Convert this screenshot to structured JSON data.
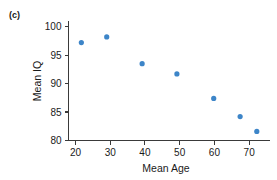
{
  "panel": {
    "label": "(c)"
  },
  "chart_data": {
    "type": "scatter",
    "title": "",
    "xlabel": "Mean Age",
    "ylabel": "Mean IQ",
    "xlim": [
      18,
      76
    ],
    "ylim": [
      80,
      101
    ],
    "xticks": [
      20,
      30,
      40,
      50,
      60,
      70
    ],
    "yticks": [
      80,
      85,
      90,
      95,
      100
    ],
    "xticklabels": [
      "20",
      "30",
      "40",
      "50",
      "60",
      "70"
    ],
    "yticklabels": [
      "80",
      "85",
      "90",
      "95",
      "100"
    ],
    "grid": false,
    "legend": false,
    "marker_color": "#3d85c8",
    "marker_size": 4,
    "series": [
      {
        "name": "Mean IQ by Mean Age",
        "x": [
          21.7,
          29.0,
          39.2,
          49.2,
          59.8,
          67.4,
          72.2
        ],
        "y": [
          97.2,
          98.2,
          93.5,
          91.7,
          87.4,
          84.2,
          81.6
        ]
      }
    ],
    "points": [
      {
        "x": 21.7,
        "y": 97.2
      },
      {
        "x": 29.0,
        "y": 98.2
      },
      {
        "x": 39.2,
        "y": 93.5
      },
      {
        "x": 49.2,
        "y": 91.7
      },
      {
        "x": 59.8,
        "y": 87.4
      },
      {
        "x": 67.4,
        "y": 84.2
      },
      {
        "x": 72.2,
        "y": 81.6
      }
    ]
  }
}
